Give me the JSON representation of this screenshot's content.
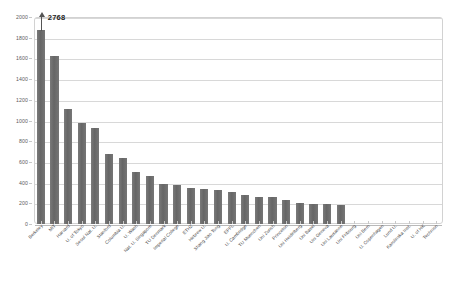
{
  "chart_data": {
    "type": "bar",
    "title": "",
    "subtitle": "",
    "xlabel": "",
    "ylabel": "",
    "ylim": [
      0,
      2000
    ],
    "ytick_step": 200,
    "yticks": [
      0,
      200,
      400,
      600,
      800,
      1000,
      1200,
      1400,
      1600,
      1800,
      2000
    ],
    "ytick_labels": [
      "0",
      "200",
      "400",
      "600",
      "800",
      "1000",
      "1200",
      "1400",
      "1600",
      "1800",
      "2000"
    ],
    "grid": true,
    "legend": "none",
    "bar_color": "#6f6f6f",
    "gridline_color": "#d8d8d8",
    "axis_color": "#b9b9b9",
    "annotations": [
      {
        "name": "truncation-callout",
        "text": "2768",
        "series_index": 0,
        "category": "Berkeley",
        "actual_value": 2768,
        "clipped_value": 1870
      }
    ],
    "categories": [
      "Berkeley",
      "MIT",
      "Harvard",
      "U. of Tokyo",
      "Seoul Nat. U.",
      "Stanford",
      "Columbia U.",
      "U. Wash",
      "Nat. U. Singapore",
      "TU Denmark",
      "Imperial College",
      "ETHZ",
      "Hebrew U.",
      "Shang Jiao Tong",
      "EPFL",
      "U. Cambridge",
      "TU Muenchen",
      "Uni Zurich",
      "Princeton",
      "Uni Heidelberg",
      "Uni Basel",
      "Uni Geneva",
      "Uni Lausanne",
      "Uni Fribourg",
      "Uni Bern",
      "U. Copenhagen",
      "Lund U.",
      "Karolinska Inst.",
      "U. of HK",
      "Technion"
    ],
    "values": [
      2768,
      1625,
      1115,
      975,
      930,
      680,
      640,
      500,
      465,
      390,
      375,
      345,
      335,
      325,
      310,
      280,
      265,
      260,
      230,
      200,
      195,
      190,
      180,
      0,
      0,
      0,
      0,
      0,
      0,
      0
    ]
  }
}
